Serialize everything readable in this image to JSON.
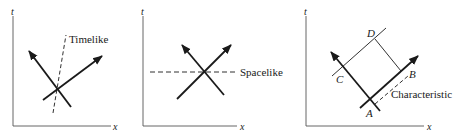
{
  "figure": {
    "panels": [
      {
        "id": "timelike",
        "axis_t_label": "t",
        "axis_x_label": "x",
        "curve_label": "Timelike"
      },
      {
        "id": "spacelike",
        "axis_t_label": "t",
        "axis_x_label": "x",
        "curve_label": "Spacelike"
      },
      {
        "id": "characteristic",
        "axis_t_label": "t",
        "axis_x_label": "x",
        "curve_label": "Characteristic",
        "points": {
          "A": "A",
          "B": "B",
          "C": "C",
          "D": "D"
        }
      }
    ],
    "colors": {
      "ink": "#1a1a1a",
      "axis": "#555555",
      "background": "#ffffff"
    }
  }
}
